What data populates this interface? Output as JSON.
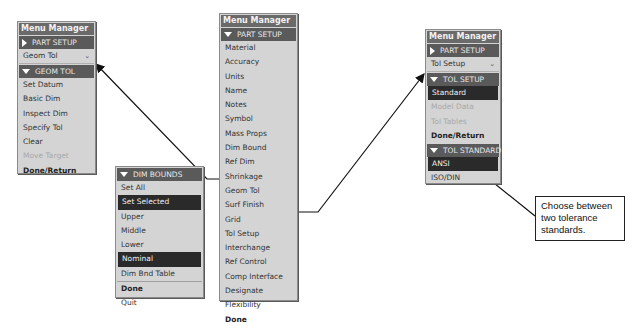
{
  "left_panel": {
    "title": "Menu Manager",
    "part_setup_header": "PART SETUP",
    "dropdown_value": "Geom Tol",
    "section_header": "GEOM TOL",
    "items": [
      {
        "label": "Set Datum",
        "state": "normal"
      },
      {
        "label": "Basic Dim",
        "state": "normal"
      },
      {
        "label": "Inspect Dim",
        "state": "normal"
      },
      {
        "label": "Specify Tol",
        "state": "normal"
      },
      {
        "label": "Clear",
        "state": "normal"
      },
      {
        "label": "Move Target",
        "state": "disabled"
      },
      {
        "label": "Done/Return",
        "state": "bold"
      }
    ]
  },
  "center_panel": {
    "title": "Menu Manager",
    "section_header": "PART SETUP",
    "items": [
      {
        "label": "Material"
      },
      {
        "label": "Accuracy"
      },
      {
        "label": "Units"
      },
      {
        "label": "Name"
      },
      {
        "label": "Notes"
      },
      {
        "label": "Symbol"
      },
      {
        "label": "Mass Props"
      },
      {
        "label": "Dim Bound"
      },
      {
        "label": "Ref Dim"
      },
      {
        "label": "Shrinkage"
      },
      {
        "label": "Geom Tol"
      },
      {
        "label": "Surf Finish"
      },
      {
        "label": "Grid"
      },
      {
        "label": "Tol Setup"
      },
      {
        "label": "Interchange"
      },
      {
        "label": "Ref Control"
      },
      {
        "label": "Comp Interface"
      },
      {
        "label": "Designate"
      },
      {
        "label": "Flexibility"
      },
      {
        "label": "Done"
      }
    ]
  },
  "dim_bounds_panel": {
    "section_header": "DIM BOUNDS",
    "items": [
      {
        "label": "Set All"
      },
      {
        "label": "Set Selected"
      },
      {
        "label": "Upper"
      },
      {
        "label": "Middle"
      },
      {
        "label": "Lower"
      },
      {
        "label": "Nominal"
      },
      {
        "label": "Dim Bnd Table"
      },
      {
        "label": "Done"
      },
      {
        "label": "Quit"
      }
    ]
  },
  "right_panel": {
    "title": "Menu Manager",
    "part_setup_header": "PART SETUP",
    "dropdown_value": "Tol Setup",
    "tol_setup_header": "TOL SETUP",
    "tol_setup_items": [
      {
        "label": "Standard"
      },
      {
        "label": "Model Data"
      },
      {
        "label": "Tol Tables"
      },
      {
        "label": "Done/Return"
      }
    ],
    "tol_standard_header": "TOL STANDARD",
    "tol_standard_items": [
      {
        "label": "ANSI"
      },
      {
        "label": "ISO/DIN"
      }
    ]
  },
  "callout": {
    "text": "Choose between two tolerance standards."
  },
  "colors": {
    "panel_bg": "#d4d4d4",
    "header_bg": "#5a5a5a",
    "selected_bg": "#2a2a2a",
    "disabled_text": "#a8a8a8"
  }
}
